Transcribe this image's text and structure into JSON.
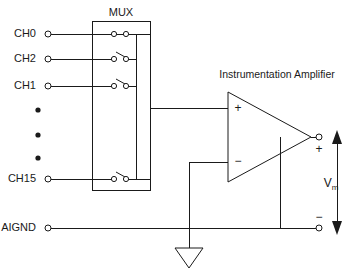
{
  "diagram": {
    "type": "schematic",
    "blocks": {
      "mux": {
        "label": "MUX",
        "description": "Analog multiplexer selecting one of 16 input channels"
      },
      "amplifier": {
        "label": "Instrumentation Amplifier",
        "plus_input": "+",
        "minus_input": "−"
      }
    },
    "channels": [
      {
        "label": "CH0",
        "switch_state": "closed"
      },
      {
        "label": "CH2",
        "switch_state": "open"
      },
      {
        "label": "CH1",
        "switch_state": "open"
      },
      {
        "label": "CH15",
        "switch_state": "open"
      }
    ],
    "ellipsis_dots": 3,
    "ground": {
      "label": "AIGND",
      "symbol": "triangle-ground"
    },
    "output": {
      "voltage_label": "V",
      "voltage_subscript": "m",
      "plus_terminal": "+",
      "minus_terminal": "−"
    },
    "colors": {
      "line": "#1a1a1a",
      "background": "#ffffff"
    }
  }
}
